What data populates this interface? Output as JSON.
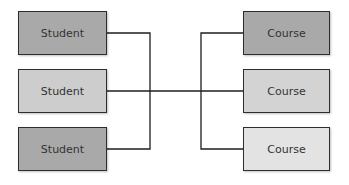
{
  "diagram": {
    "left_nodes": [
      {
        "label": "Student",
        "fill": "#a9a9a9"
      },
      {
        "label": "Student",
        "fill": "#cdcdcd"
      },
      {
        "label": "Student",
        "fill": "#a9a9a9"
      }
    ],
    "right_nodes": [
      {
        "label": "Course",
        "fill": "#a9a9a9"
      },
      {
        "label": "Course",
        "fill": "#d3d3d3"
      },
      {
        "label": "Course",
        "fill": "#e3e3e3"
      }
    ],
    "connector_color": "#1e1e1e"
  }
}
